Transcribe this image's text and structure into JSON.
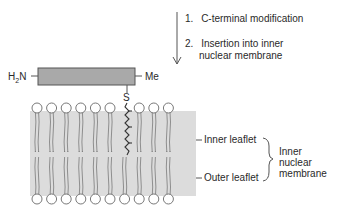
{
  "steps": [
    {
      "num": "1.",
      "text": "C-terminal modification"
    },
    {
      "num": "2.",
      "text": "Insertion into inner",
      "text2": "nuclear membrane"
    }
  ],
  "protein": {
    "n_terminus": "H",
    "n_sub": "2",
    "n_atom": "N",
    "c_terminus": "Me",
    "anchor_atom": "S"
  },
  "membrane_labels": {
    "inner_leaflet": "Inner leaflet",
    "outer_leaflet": "Outer leaflet",
    "membrane_name_1": "Inner",
    "membrane_name_2": "nuclear",
    "membrane_name_3": "membrane"
  },
  "colors": {
    "protein_fill": "#a9a9a9",
    "membrane_fill": "#dcdcdc",
    "line": "#555555"
  }
}
